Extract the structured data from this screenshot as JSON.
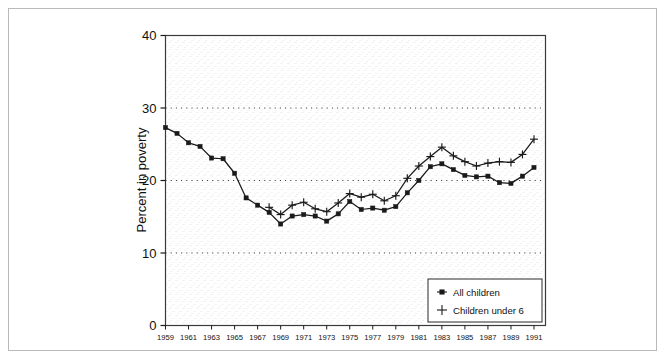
{
  "chart_data": {
    "type": "line",
    "title": "",
    "xlabel": "",
    "ylabel": "Percent in poverty",
    "xlim": [
      1959,
      1992
    ],
    "ylim": [
      0,
      40
    ],
    "yticks": [
      0,
      10,
      20,
      30,
      40
    ],
    "xticks": [
      1959,
      1961,
      1963,
      1965,
      1967,
      1969,
      1971,
      1973,
      1975,
      1977,
      1979,
      1981,
      1983,
      1985,
      1987,
      1989,
      1991
    ],
    "grid": "horizontal-dotted",
    "legend_position": "bottom-right",
    "x": [
      1959,
      1960,
      1961,
      1962,
      1963,
      1964,
      1965,
      1966,
      1967,
      1968,
      1969,
      1970,
      1971,
      1972,
      1973,
      1974,
      1975,
      1976,
      1977,
      1978,
      1979,
      1980,
      1981,
      1982,
      1983,
      1984,
      1985,
      1986,
      1987,
      1988,
      1989,
      1990,
      1991
    ],
    "series": [
      {
        "name": "All children",
        "marker": "filled-square",
        "color": "#1a1a1a",
        "x": [
          1959,
          1960,
          1961,
          1962,
          1963,
          1964,
          1965,
          1966,
          1967,
          1968,
          1969,
          1970,
          1971,
          1972,
          1973,
          1974,
          1975,
          1976,
          1977,
          1978,
          1979,
          1980,
          1981,
          1982,
          1983,
          1984,
          1985,
          1986,
          1987,
          1988,
          1989,
          1990,
          1991
        ],
        "values": [
          27.3,
          26.5,
          25.2,
          24.7,
          23.1,
          23.0,
          21.0,
          17.6,
          16.6,
          15.6,
          14.0,
          15.1,
          15.3,
          15.1,
          14.4,
          15.4,
          17.1,
          16.0,
          16.2,
          15.9,
          16.4,
          18.3,
          20.0,
          21.9,
          22.3,
          21.5,
          20.7,
          20.5,
          20.6,
          19.7,
          19.6,
          20.6,
          21.8
        ]
      },
      {
        "name": "Children under 6",
        "marker": "plus",
        "color": "#1a1a1a",
        "x": [
          1968,
          1969,
          1970,
          1971,
          1972,
          1973,
          1974,
          1975,
          1976,
          1977,
          1978,
          1979,
          1980,
          1981,
          1982,
          1983,
          1984,
          1985,
          1986,
          1987,
          1988,
          1989,
          1990,
          1991
        ],
        "values": [
          16.3,
          15.3,
          16.6,
          17.0,
          16.1,
          15.7,
          16.9,
          18.2,
          17.7,
          18.1,
          17.2,
          17.9,
          20.3,
          22.0,
          23.3,
          24.6,
          23.4,
          22.6,
          22.0,
          22.4,
          22.6,
          22.5,
          23.6,
          25.7
        ]
      }
    ]
  },
  "axis": {
    "ylabel": "Percent in poverty"
  },
  "legend": {
    "items": [
      {
        "label": "All children",
        "marker": "filled-square"
      },
      {
        "label": "Children under 6",
        "marker": "plus"
      }
    ]
  }
}
